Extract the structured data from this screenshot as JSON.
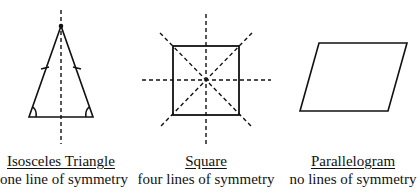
{
  "figures": [
    {
      "name": "Isosceles Triangle",
      "caption": "one line of symmetry",
      "lines_of_symmetry": 1
    },
    {
      "name": "Square",
      "caption": "four lines of symmetry",
      "lines_of_symmetry": 4
    },
    {
      "name": "Parallelogram",
      "caption": "no lines of symmetry",
      "lines_of_symmetry": 0
    }
  ],
  "colors": {
    "stroke": "#111111",
    "background": "#ffffff"
  }
}
